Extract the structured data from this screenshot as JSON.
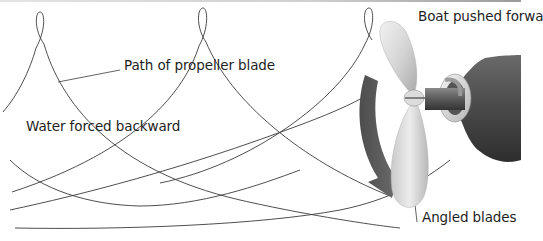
{
  "diagram": {
    "labels": {
      "path": "Path of propeller blade",
      "water": "Water forced backward",
      "boat": "Boat pushed forwa",
      "angled": "Angled blades"
    },
    "elements": [
      "helical-blade-path",
      "three-bladed-propeller",
      "rotation-arrow",
      "propeller-shaft-housing"
    ],
    "colors": {
      "line": "#3a3a3a",
      "blade": "#d9d9d9",
      "arrow": "#5a5a5a",
      "housing": "#4a4a4a",
      "text": "#1e1e1e"
    }
  }
}
